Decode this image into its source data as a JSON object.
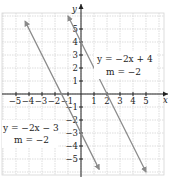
{
  "chart_data": {
    "type": "line",
    "title": "",
    "xlabel": "x",
    "ylabel": "y",
    "xlim": [
      -6,
      6
    ],
    "ylim": [
      -6,
      6
    ],
    "grid": true,
    "x_ticks": [
      -5,
      -4,
      -3,
      -2,
      -1,
      1,
      2,
      3,
      4,
      5
    ],
    "y_ticks": [
      -5,
      -4,
      -3,
      -2,
      -1,
      1,
      2,
      3,
      4,
      5
    ],
    "x_tick_labels": [
      "−5",
      "−4",
      "−3",
      "−2",
      "−1",
      "1",
      "2",
      "3",
      "4",
      "5"
    ],
    "y_tick_labels": [
      "−5",
      "−4",
      "−3",
      "−2",
      "−1",
      "1",
      "2",
      "3",
      "4",
      "5"
    ],
    "series": [
      {
        "name": "y = −2x + 4",
        "slope": -2,
        "intercept": 4,
        "x": [
          -1,
          5
        ],
        "y": [
          6,
          -6
        ],
        "annotation": {
          "equation": "y = −2x + 4",
          "slope_label": "m = −2"
        }
      },
      {
        "name": "y = −2x − 3",
        "slope": -2,
        "intercept": -3,
        "x": [
          -4.3,
          1.4
        ],
        "y": [
          5.6,
          -5.8
        ],
        "annotation": {
          "equation": "y = −2x − 3",
          "slope_label": "m = −2"
        }
      }
    ],
    "colors": {
      "line": "#8a8a8a",
      "axis": "#222222",
      "grid": "#d4d4d4"
    }
  },
  "labels": {
    "x_axis": "x",
    "y_axis": "y",
    "line1_eq": "y = −2x + 4",
    "line1_m": "m = −2",
    "line2_eq": "y = −2x − 3",
    "line2_m": "m = −2"
  }
}
